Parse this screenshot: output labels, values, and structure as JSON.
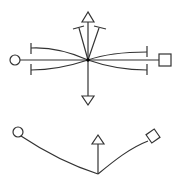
{
  "diagram": {
    "colors": {
      "stroke": "#333333",
      "background": "#ffffff",
      "hub": "#000000"
    },
    "top": {
      "hub": {
        "x": 88,
        "y": 60
      },
      "left_node": {
        "shape": "circle",
        "x": 15,
        "y": 60,
        "r": 5
      },
      "right_node": {
        "shape": "square",
        "x": 159,
        "y": 54,
        "size": 12
      },
      "up_arrow": {
        "shape": "triangle-up",
        "apex": [
          88,
          12
        ]
      },
      "down_arrow": {
        "shape": "triangle-down",
        "apex": [
          88,
          105
        ]
      },
      "t_bar_ends": [
        {
          "x": 31,
          "y": 48
        },
        {
          "x": 31,
          "y": 70
        },
        {
          "x": 147,
          "y": 52
        },
        {
          "x": 147,
          "y": 70
        }
      ],
      "fan_ends": [
        {
          "x": 79,
          "y": 27
        },
        {
          "x": 101,
          "y": 27
        }
      ]
    },
    "bottom": {
      "left_node": {
        "shape": "circle",
        "x": 18,
        "y": 132,
        "r": 5
      },
      "right_node": {
        "shape": "square-rotated",
        "x": 153,
        "y": 137
      },
      "vertex": {
        "x": 98,
        "y": 174
      },
      "up_arrow": {
        "shape": "triangle-up",
        "apex": [
          98,
          136
        ]
      }
    }
  }
}
